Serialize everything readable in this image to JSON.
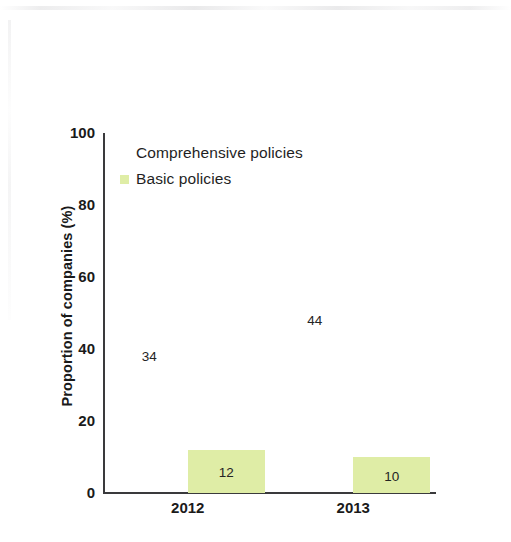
{
  "chart_data": {
    "type": "bar",
    "title": "",
    "subtitle": "",
    "xlabel": "",
    "ylabel": "Proportion of companies (%)",
    "categories": [
      "2012",
      "2013"
    ],
    "ylim": [
      0,
      100
    ],
    "yticks": [
      "0",
      "20",
      "40",
      "60",
      "80",
      "100"
    ],
    "ytick_values": [
      0,
      20,
      40,
      60,
      80,
      100
    ],
    "grid": false,
    "legend_position": "top-left inside plot area",
    "series": [
      {
        "name": "Comprehensive policies",
        "values": [
          34,
          44
        ],
        "value_labels": [
          "34",
          "44"
        ],
        "color": "#ffffff",
        "swatch_visible": false,
        "bars_visible": false,
        "label_positions": [
          "above-bar",
          "above-bar"
        ]
      },
      {
        "name": "Basic policies",
        "values": [
          12,
          10
        ],
        "value_labels": [
          "12",
          "10"
        ],
        "color": "#dfeda6",
        "swatch_visible": true,
        "bars_visible": true,
        "label_positions": [
          "inside-bar",
          "inside-bar"
        ]
      }
    ],
    "legend": [
      {
        "label": "Comprehensive policies",
        "color": "#ffffff",
        "swatch_visible": false
      },
      {
        "label": "Basic policies",
        "color": "#dfeda6",
        "swatch_visible": true
      }
    ],
    "axis_color": "#3a3a3c",
    "background_color": "#ffffff",
    "text_color": "#1a1a1a"
  }
}
